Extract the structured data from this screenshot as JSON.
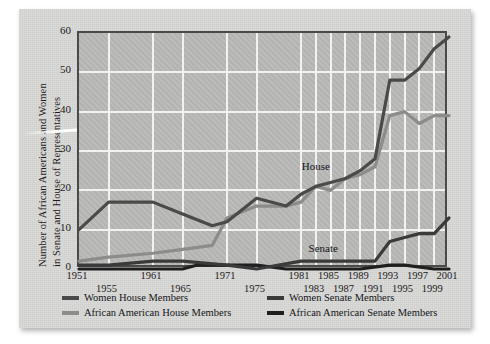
{
  "chart_data": {
    "type": "line",
    "title": "",
    "xlabel": "",
    "ylabel_line1": "Number of African Americans and Women",
    "ylabel_line2": "in Senate and House of Representatives",
    "ylim": [
      0,
      60
    ],
    "yticks": [
      0,
      10,
      20,
      30,
      40,
      50,
      60
    ],
    "xlim": [
      1951,
      2001
    ],
    "xticks_upper": [
      "1951",
      "1961",
      "1971",
      "1981",
      "1985",
      "1989",
      "1993",
      "1997",
      "2001"
    ],
    "xticks_lower": [
      "1955",
      "1965",
      "1975",
      "1983",
      "1987",
      "1991",
      "1995",
      "1999"
    ],
    "xtick_upper_years": [
      1951,
      1961,
      1971,
      1981,
      1985,
      1989,
      1993,
      1997,
      2001
    ],
    "xtick_lower_years": [
      1955,
      1965,
      1975,
      1983,
      1987,
      1991,
      1995,
      1999
    ],
    "gridlines": "horizontal and vertical, white",
    "legend_position": "below plot, two columns",
    "annotations": [
      {
        "text": "House",
        "x": 1983,
        "y": 26
      },
      {
        "text": "Senate",
        "x": 1984,
        "y": 5
      }
    ],
    "series": [
      {
        "name": "Women House Members",
        "color": "#4a4a4a",
        "x": [
          1951,
          1955,
          1961,
          1965,
          1969,
          1971,
          1975,
          1979,
          1981,
          1983,
          1985,
          1987,
          1989,
          1991,
          1993,
          1995,
          1997,
          1999,
          2001
        ],
        "values": [
          10,
          17,
          17,
          14,
          11,
          12,
          18,
          16,
          19,
          21,
          22,
          23,
          25,
          28,
          48,
          48,
          51,
          56,
          59
        ]
      },
      {
        "name": "Women Senate Members",
        "color": "#3a3a3a",
        "x": [
          1951,
          1955,
          1961,
          1965,
          1971,
          1975,
          1981,
          1985,
          1989,
          1991,
          1993,
          1995,
          1997,
          1999,
          2001
        ],
        "values": [
          1,
          1,
          2,
          2,
          1,
          0,
          2,
          2,
          2,
          2,
          7,
          8,
          9,
          9,
          13
        ]
      },
      {
        "name": "African American House Members",
        "color": "#8c8c8a",
        "x": [
          1951,
          1955,
          1961,
          1965,
          1969,
          1971,
          1975,
          1979,
          1981,
          1983,
          1985,
          1987,
          1989,
          1991,
          1993,
          1995,
          1997,
          1999,
          2001
        ],
        "values": [
          2,
          3,
          4,
          5,
          6,
          13,
          16,
          16,
          17,
          21,
          20,
          23,
          24,
          26,
          39,
          40,
          37,
          39,
          39
        ]
      },
      {
        "name": "African American Senate Members",
        "color": "#1f1f1f",
        "x": [
          1951,
          1965,
          1967,
          1975,
          1979,
          1981,
          1985,
          1989,
          1993,
          1995,
          1999,
          2001
        ],
        "values": [
          0,
          0,
          1,
          1,
          0,
          0,
          0,
          0,
          1,
          1,
          0,
          0
        ]
      }
    ]
  },
  "legend": {
    "items": [
      {
        "label": "Women House Members",
        "color": "#4a4a4a"
      },
      {
        "label": "Women Senate Members",
        "color": "#3a3a3a"
      },
      {
        "label": "African American House Members",
        "color": "#8c8c8a"
      },
      {
        "label": "African American Senate Members",
        "color": "#1f1f1f"
      }
    ]
  }
}
